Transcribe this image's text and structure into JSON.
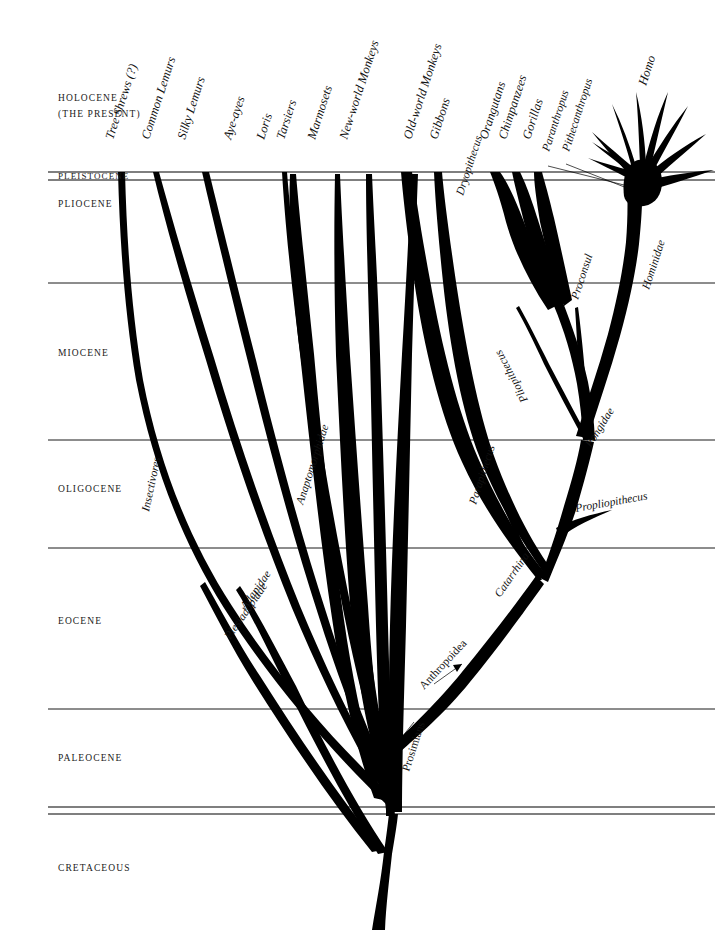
{
  "figure": {
    "kind": "phylogenetic-tree",
    "background_color": "#ffffff",
    "ink_color": "#000000"
  },
  "time_axis": {
    "orientation": "vertical",
    "present_at": "top",
    "epochs": [
      {
        "id": "holocene",
        "label": "HOLOCENE",
        "sublabel": "(THE PRESENT)",
        "label_y": 101,
        "sublabel_y": 117
      },
      {
        "id": "pleistocene",
        "label": "PLEISTOCENE",
        "sublabel": "",
        "label_y": 179,
        "sublabel_y": 0
      },
      {
        "id": "pliocene",
        "label": "PLIOCENE",
        "sublabel": "",
        "label_y": 207,
        "sublabel_y": 0
      },
      {
        "id": "miocene",
        "label": "MIOCENE",
        "sublabel": "",
        "label_y": 356,
        "sublabel_y": 0
      },
      {
        "id": "oligocene",
        "label": "OLIGOCENE",
        "sublabel": "",
        "label_y": 492,
        "sublabel_y": 0
      },
      {
        "id": "eocene",
        "label": "EOCENE",
        "sublabel": "",
        "label_y": 624,
        "sublabel_y": 0
      },
      {
        "id": "paleocene",
        "label": "PALEOCENE",
        "sublabel": "",
        "label_y": 761,
        "sublabel_y": 0
      },
      {
        "id": "cretaceous",
        "label": "CRETACEOUS",
        "sublabel": "",
        "label_y": 871,
        "sublabel_y": 0
      }
    ],
    "boundary_lines": [
      {
        "id": "holocene-pleistocene",
        "y": 172,
        "double": true,
        "y2": 180
      },
      {
        "id": "pliocene-miocene",
        "y": 283,
        "double": false,
        "y2": 0
      },
      {
        "id": "miocene-oligocene",
        "y": 440,
        "double": false,
        "y2": 0
      },
      {
        "id": "oligocene-eocene",
        "y": 548,
        "double": false,
        "y2": 0
      },
      {
        "id": "eocene-paleocene",
        "y": 709,
        "double": false,
        "y2": 0
      },
      {
        "id": "paleocene-cretaceous",
        "y": 807,
        "double": true,
        "y2": 814
      }
    ]
  },
  "tip_labels": [
    {
      "id": "tree-shrews",
      "text": "Tree Shrews (?)",
      "x": 113,
      "y": 140
    },
    {
      "id": "common-lemurs",
      "text": "Common Lemurs",
      "x": 149,
      "y": 140
    },
    {
      "id": "silky-lemurs",
      "text": "Silky Lemurs",
      "x": 185,
      "y": 140
    },
    {
      "id": "aye-ayes",
      "text": "Aye-ayes",
      "x": 231,
      "y": 140
    },
    {
      "id": "loris",
      "text": "Loris",
      "x": 264,
      "y": 140
    },
    {
      "id": "tarsiers",
      "text": "Tarsiers",
      "x": 284,
      "y": 140
    },
    {
      "id": "marmosets",
      "text": "Marmosets",
      "x": 315,
      "y": 140
    },
    {
      "id": "new-world-monkeys",
      "text": "New-world Monkeys",
      "x": 347,
      "y": 140
    },
    {
      "id": "old-world-monkeys",
      "text": "Old-world Monkeys",
      "x": 411,
      "y": 140
    },
    {
      "id": "gibbons",
      "text": "Gibbons",
      "x": 437,
      "y": 140
    },
    {
      "id": "orangutans",
      "text": "Orangutans",
      "x": 487,
      "y": 140
    },
    {
      "id": "chimpanzees",
      "text": "Chimpanzees",
      "x": 506,
      "y": 140
    },
    {
      "id": "gorillas",
      "text": "Gorillas",
      "x": 530,
      "y": 140
    },
    {
      "id": "homo",
      "text": "Homo",
      "x": 646,
      "y": 86
    }
  ],
  "fossil_labels": [
    {
      "id": "dryopithecus",
      "text": "Dryopithecus",
      "x": 463,
      "y": 196
    },
    {
      "id": "paranthropus",
      "text": "Paranthropus",
      "x": 549,
      "y": 152
    },
    {
      "id": "pithecanthropus",
      "text": "Pithecanthropus",
      "x": 569,
      "y": 152
    },
    {
      "id": "proconsul",
      "text": "Proconsul",
      "x": 578,
      "y": 300
    },
    {
      "id": "pliopithecus",
      "text": "Pliopithecus",
      "x": 528,
      "y": 400
    },
    {
      "id": "parapithecus",
      "text": "Parapithecus",
      "x": 476,
      "y": 505
    },
    {
      "id": "propliopithecus",
      "text": "Propliopithecus",
      "x": 576,
      "y": 512
    },
    {
      "id": "anaptomorphidae",
      "text": "Anaptomorphidae",
      "x": 303,
      "y": 505
    },
    {
      "id": "adapidae",
      "text": "Adapidae",
      "x": 246,
      "y": 610
    },
    {
      "id": "plesiadapidae",
      "text": "Plesiadapidae",
      "x": 230,
      "y": 640
    },
    {
      "id": "insectivores",
      "text": "Insectivores",
      "x": 149,
      "y": 512
    },
    {
      "id": "hominidae",
      "text": "Hominidae",
      "x": 649,
      "y": 290
    },
    {
      "id": "pongidae",
      "text": "Pongidae",
      "x": 591,
      "y": 448
    },
    {
      "id": "catarrhina",
      "text": "Catarrhina",
      "x": 500,
      "y": 598
    }
  ],
  "group_labels": [
    {
      "id": "prosimians",
      "text": "Prosimians",
      "x": 409,
      "y": 760
    },
    {
      "id": "anthropoidea",
      "text": "Anthropoidea",
      "x": 432,
      "y": 680
    }
  ]
}
